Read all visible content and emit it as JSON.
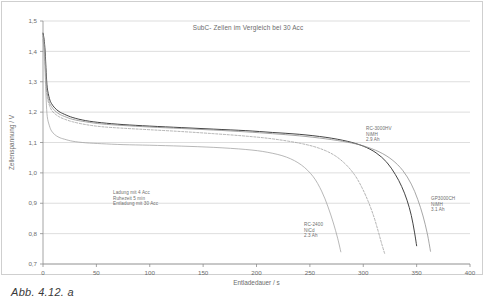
{
  "figure": {
    "caption": "Abb. 4.12. a"
  },
  "annotations": {
    "conditions": "Ladung mit 4 Acc\nRuhezeit 5 min\nEntladung mit 30 Acc",
    "rc3000hv": "RC-3000HV\nNiMH\n2.9 Ah",
    "gp3000ch": "GP3000CH\nNiMH\n3.1 Ah",
    "rc2400": "RC-2400\nNiCd\n2.3 Ah"
  },
  "chart_data": {
    "type": "line",
    "title": "SubC- Zellen im Vergleich bei 30 Acc",
    "xlabel": "Entladedauer / s",
    "ylabel": "Zellenspannung / V",
    "xlim": [
      0,
      400
    ],
    "ylim": [
      0.7,
      1.5
    ],
    "xticks": [
      0,
      50,
      100,
      150,
      200,
      250,
      300,
      350,
      400
    ],
    "yticks": [
      0.7,
      0.8,
      0.9,
      1.0,
      1.1,
      1.2,
      1.3,
      1.4,
      1.5
    ],
    "xtick_labels": [
      "0",
      "50",
      "100",
      "150",
      "200",
      "250",
      "300",
      "350",
      "400"
    ],
    "ytick_labels": [
      "0,7",
      "0,8",
      "0,9",
      "1,0",
      "1,1",
      "1,2",
      "1,3",
      "1,4",
      "1,5"
    ],
    "grid": "horizontal",
    "legend": "annotations-on-plot",
    "colors": {
      "rc3000hv": "#3a3a3a",
      "gp3000ch": "#8a8a8a",
      "rc2400": "#a0a0a0",
      "dashed": "#9a9a9a",
      "grid": "#c8c8c8",
      "axis": "#8d8d8d"
    },
    "series": [
      {
        "name": "RC-3000HV NiMH 2.9 Ah",
        "style": "solid-dark",
        "color": "#3a3a3a",
        "x": [
          0,
          1,
          2,
          3,
          4,
          6,
          8,
          11,
          15,
          20,
          28,
          40,
          55,
          75,
          100,
          130,
          160,
          190,
          215,
          240,
          265,
          285,
          300,
          312,
          322,
          330,
          336,
          341,
          345,
          348,
          350
        ],
        "y": [
          1.46,
          1.44,
          1.4,
          1.33,
          1.28,
          1.245,
          1.228,
          1.214,
          1.202,
          1.193,
          1.182,
          1.172,
          1.165,
          1.159,
          1.154,
          1.149,
          1.144,
          1.139,
          1.133,
          1.127,
          1.117,
          1.104,
          1.088,
          1.066,
          1.035,
          0.995,
          0.955,
          0.91,
          0.86,
          0.805,
          0.76
        ]
      },
      {
        "name": "GP3000CH NiMH 3.1 Ah",
        "style": "solid-mid",
        "color": "#8a8a8a",
        "x": [
          0,
          1,
          2,
          3,
          4,
          6,
          8,
          11,
          15,
          20,
          28,
          40,
          55,
          75,
          100,
          130,
          160,
          190,
          215,
          240,
          265,
          285,
          300,
          315,
          327,
          337,
          345,
          351,
          356,
          360,
          363
        ],
        "y": [
          1.455,
          1.43,
          1.38,
          1.31,
          1.262,
          1.232,
          1.218,
          1.205,
          1.194,
          1.186,
          1.176,
          1.168,
          1.161,
          1.156,
          1.151,
          1.146,
          1.141,
          1.135,
          1.129,
          1.122,
          1.112,
          1.101,
          1.089,
          1.069,
          1.043,
          1.008,
          0.963,
          0.913,
          0.858,
          0.8,
          0.742
        ]
      },
      {
        "name": "RC-3000HV dashed variant",
        "style": "dashed",
        "color": "#9a9a9a",
        "x": [
          0,
          1,
          2,
          3,
          4,
          6,
          8,
          11,
          15,
          20,
          28,
          40,
          55,
          75,
          100,
          130,
          160,
          190,
          215,
          240,
          258,
          272,
          283,
          292,
          299,
          305,
          310,
          314,
          317,
          320
        ],
        "y": [
          1.45,
          1.42,
          1.36,
          1.29,
          1.248,
          1.222,
          1.207,
          1.195,
          1.185,
          1.177,
          1.168,
          1.159,
          1.152,
          1.147,
          1.142,
          1.136,
          1.129,
          1.121,
          1.112,
          1.098,
          1.082,
          1.06,
          1.03,
          0.993,
          0.95,
          0.903,
          0.855,
          0.808,
          0.77,
          0.735
        ]
      },
      {
        "name": "RC-2400 NiCd 2.3 Ah",
        "style": "solid-light",
        "color": "#a0a0a0",
        "x": [
          0,
          1,
          2,
          3,
          4,
          6,
          8,
          11,
          15,
          20,
          28,
          40,
          55,
          75,
          100,
          130,
          160,
          190,
          210,
          228,
          242,
          253,
          261,
          267,
          272,
          276,
          279
        ],
        "y": [
          1.44,
          1.4,
          1.33,
          1.24,
          1.185,
          1.155,
          1.138,
          1.126,
          1.117,
          1.111,
          1.104,
          1.099,
          1.096,
          1.093,
          1.091,
          1.088,
          1.084,
          1.077,
          1.068,
          1.052,
          1.026,
          0.988,
          0.94,
          0.888,
          0.835,
          0.785,
          0.74
        ]
      }
    ]
  }
}
